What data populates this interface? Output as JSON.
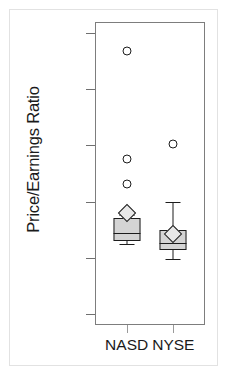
{
  "chart_data": {
    "type": "boxplot",
    "title": "",
    "xlabel": "",
    "ylabel": "Price/Earnings Ratio",
    "ylim": [
      -60,
      210
    ],
    "yticks": [
      -50,
      0,
      50,
      100,
      150,
      200
    ],
    "ytick_labels": [
      "-50",
      "0",
      "50",
      "100",
      "150",
      "200"
    ],
    "categories": [
      "NASD",
      "NYSE"
    ],
    "grid": false,
    "legend": null,
    "groups": [
      {
        "label": "NASD",
        "whisker_low": 12,
        "q1": 15,
        "median": 22,
        "q3": 35,
        "whisker_high": 38,
        "mean": 40,
        "outliers": [
          184,
          88,
          66
        ]
      },
      {
        "label": "NYSE",
        "whisker_low": -1,
        "q1": 7,
        "median": 13,
        "q3": 25,
        "whisker_high": 50,
        "mean": 21,
        "outliers": [
          101
        ]
      }
    ],
    "colors": {
      "box_fill": "#d4d4d4",
      "box_edge": "#1c1c1c",
      "mean_marker_fill": "#e8e8e8",
      "outlier_edge": "#1c1c1c",
      "frame": "#7d7d7d",
      "text": "#1a1a1a"
    }
  }
}
